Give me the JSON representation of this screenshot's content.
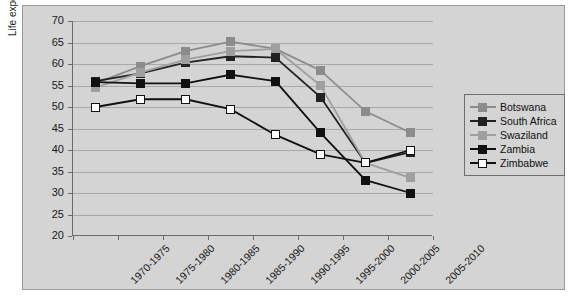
{
  "chart_data": {
    "type": "line",
    "title": "",
    "xlabel": "",
    "ylabel": "Life expectancy at birth (years)",
    "categories": [
      "1970-1975",
      "1975-1980",
      "1980-1985",
      "1985-1990",
      "1990-1995",
      "1995-2000",
      "2000-2005",
      "2005-2010"
    ],
    "ylim": [
      20,
      70
    ],
    "ytick_step": 5,
    "yticks": [
      70,
      65,
      60,
      55,
      50,
      45,
      40,
      35,
      30,
      25,
      20
    ],
    "grid": true,
    "legend_position": "right",
    "series": [
      {
        "name": "Botswana",
        "color": "#8c8c8c",
        "marker": "square",
        "marker_fill": "#8c8c8c",
        "values": [
          55.5,
          59.5,
          63.0,
          65.2,
          63.5,
          58.5,
          49.0,
          44.0
        ]
      },
      {
        "name": "South Africa",
        "color": "#222222",
        "marker": "square",
        "marker_fill": "#222222",
        "values": [
          56.0,
          57.8,
          60.3,
          61.8,
          61.5,
          52.3,
          37.0,
          39.5
        ]
      },
      {
        "name": "Swaziland",
        "color": "#9f9f9f",
        "marker": "square",
        "marker_fill": "#9f9f9f",
        "values": [
          54.5,
          58.0,
          61.0,
          63.0,
          63.5,
          55.0,
          37.0,
          33.5
        ]
      },
      {
        "name": "Zambia",
        "color": "#111111",
        "marker": "square",
        "marker_fill": "#111111",
        "values": [
          55.8,
          55.5,
          55.5,
          57.5,
          56.0,
          44.0,
          33.0,
          30.0
        ]
      },
      {
        "name": "Zimbabwe",
        "color": "#111111",
        "marker": "square-open",
        "marker_fill": "#ffffff",
        "values": [
          50.0,
          51.8,
          51.8,
          49.5,
          43.5,
          39.0,
          37.0,
          40.0
        ]
      }
    ]
  },
  "legend": {
    "entries": [
      "Botswana",
      "South Africa",
      "Swaziland",
      "Zambia",
      "Zimbabwe"
    ]
  }
}
